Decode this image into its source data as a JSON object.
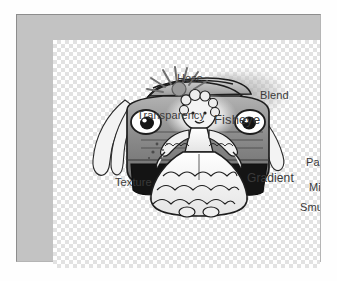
{
  "canvas": {
    "background_type": "transparency-checkerboard",
    "checker_light": "#ffffff",
    "checker_dark": "#e2e2e2",
    "frame_color": "#c3c3c3",
    "page_background": "#fefefe"
  },
  "artwork": {
    "description": "Grayscale cartoon drawing of a car with headlight eyes and a doll figure in a ruffled dress",
    "ink_color": "#1d1d1d",
    "body_fill": "#8f8f8f",
    "tire_fill": "#141414",
    "dress_fill": "#f2f2f2"
  },
  "labels": [
    {
      "id": "hose",
      "text": "Hose"
    },
    {
      "id": "blend",
      "text": "Blend"
    },
    {
      "id": "transparency",
      "text": "Transparency"
    },
    {
      "id": "fisheye",
      "text": "Fisheye"
    },
    {
      "id": "texture",
      "text": "Texture"
    },
    {
      "id": "gradient",
      "text": "Gradient"
    },
    {
      "id": "pattern",
      "text": "Pattern"
    },
    {
      "id": "mirror",
      "text": "Mirror"
    },
    {
      "id": "smudge",
      "text": "Smudge"
    }
  ],
  "label_color": "#3a3a3a"
}
